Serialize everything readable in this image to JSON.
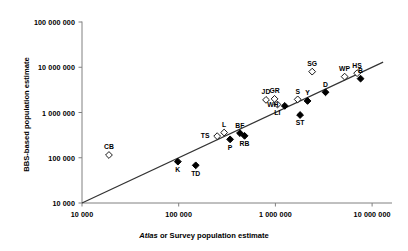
{
  "chart_data": {
    "type": "scatter",
    "title": "",
    "xlabel_italic": "Atlas",
    "xlabel_rest": " or Survey population estimate",
    "ylabel": "BBS-based population estimate",
    "xscale": "log",
    "yscale": "log",
    "xlim": [
      10000,
      10000000
    ],
    "ylim": [
      10000,
      100000000
    ],
    "grid": false,
    "legend": "none",
    "xticks": [
      "10 000",
      "100 000",
      "1 000 000",
      "10 000 000"
    ],
    "xtick_values": [
      10000,
      100000,
      1000000,
      10000000
    ],
    "yticks": [
      "10 000",
      "100 000",
      "1 000 000",
      "10 000 000",
      "100 000 000"
    ],
    "ytick_values": [
      10000,
      100000,
      1000000,
      10000000,
      100000000
    ],
    "reference_line": {
      "label": "1:1 line",
      "from": [
        10000,
        10000
      ],
      "to": [
        13000000,
        13000000
      ]
    },
    "points": [
      {
        "label": "CB",
        "x": 19000,
        "y": 115000,
        "marker": "open",
        "label_pos": "above"
      },
      {
        "label": "K",
        "x": 98000,
        "y": 82000,
        "marker": "filled",
        "label_pos": "below"
      },
      {
        "label": "TD",
        "x": 150000,
        "y": 68000,
        "marker": "filled",
        "label_pos": "below"
      },
      {
        "label": "TS",
        "x": 250000,
        "y": 300000,
        "marker": "open",
        "label_pos": "left"
      },
      {
        "label": "L",
        "x": 295000,
        "y": 360000,
        "marker": "open",
        "label_pos": "above"
      },
      {
        "label": "P",
        "x": 340000,
        "y": 255000,
        "marker": "filled",
        "label_pos": "below"
      },
      {
        "label": "BF",
        "x": 430000,
        "y": 350000,
        "marker": "filled",
        "label_pos": "above"
      },
      {
        "label": "RB",
        "x": 480000,
        "y": 305000,
        "marker": "filled",
        "label_pos": "below"
      },
      {
        "label": "JD",
        "x": 800000,
        "y": 1900000,
        "marker": "open",
        "label_pos": "above"
      },
      {
        "label": "GR",
        "x": 980000,
        "y": 2000000,
        "marker": "open",
        "label_pos": "above"
      },
      {
        "label": "LI",
        "x": 1050000,
        "y": 1500000,
        "marker": "open",
        "label_pos": "below"
      },
      {
        "label": "WH",
        "x": 1250000,
        "y": 1400000,
        "marker": "filled",
        "label_pos": "left"
      },
      {
        "label": "S",
        "x": 1700000,
        "y": 1950000,
        "marker": "open",
        "label_pos": "above"
      },
      {
        "label": "ST",
        "x": 1800000,
        "y": 880000,
        "marker": "filled",
        "label_pos": "below"
      },
      {
        "label": "Y",
        "x": 2150000,
        "y": 1800000,
        "marker": "filled",
        "label_pos": "above"
      },
      {
        "label": "SG",
        "x": 2400000,
        "y": 8000000,
        "marker": "open",
        "label_pos": "above"
      },
      {
        "label": "D",
        "x": 3300000,
        "y": 2800000,
        "marker": "filled",
        "label_pos": "above"
      },
      {
        "label": "WP",
        "x": 5200000,
        "y": 6200000,
        "marker": "open",
        "label_pos": "above"
      },
      {
        "label": "HS",
        "x": 7000000,
        "y": 7400000,
        "marker": "open",
        "label_pos": "above"
      },
      {
        "label": "B",
        "x": 7600000,
        "y": 5600000,
        "marker": "filled",
        "label_pos": "above"
      }
    ]
  },
  "colors": {
    "axis": "#808080",
    "line": "#333333",
    "marker": "#000000",
    "text": "#000000"
  }
}
